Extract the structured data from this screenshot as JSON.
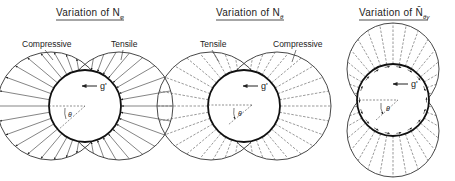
{
  "figure": {
    "panels": [
      {
        "id": "n-phi",
        "title_prefix": "Variation  of  ",
        "title_symbol": "N",
        "title_subscript": "φ",
        "labels": {
          "left": "Compressive",
          "right": "Tensile"
        },
        "gravity_label": "g'",
        "angle_label": "θ",
        "arrow_style": "solid-arrows"
      },
      {
        "id": "n-theta",
        "title_prefix": "Variation  of  ",
        "title_symbol": "N",
        "title_subscript": "θ",
        "labels": {
          "left": "Tensile",
          "right": "Compressive"
        },
        "gravity_label": "g'",
        "angle_label": "θ",
        "arrow_style": "dashed-lines"
      },
      {
        "id": "n-bar-theta-gamma",
        "title_prefix": "Variation  of  ",
        "title_symbol": "N̄",
        "title_subscript": "θγ",
        "labels": {},
        "gravity_label": "g'",
        "angle_label": "θ",
        "arrow_style": "dashed-lines-with-tangential-arrows"
      }
    ]
  }
}
